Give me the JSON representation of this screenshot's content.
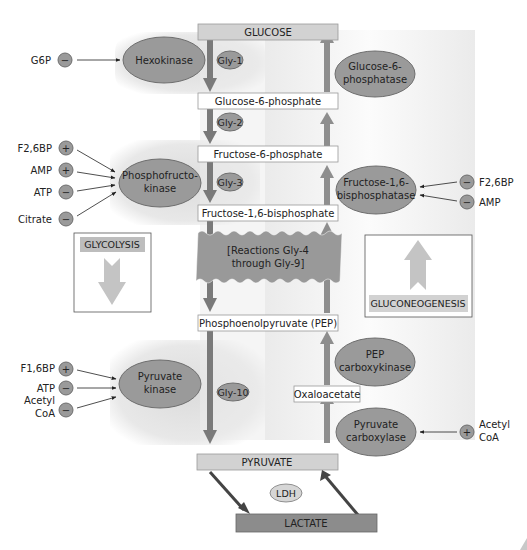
{
  "colors": {
    "enzyme_fill": "#9a9a9a",
    "enzyme_stroke": "#6e6e6e",
    "arrow_glycolysis": "#7a7a7a",
    "arrow_gluconeo": "#8e8e8e",
    "box_header_fill": "#d2d2d2",
    "metabolite_box_fill": "#ffffff",
    "lactate_fill": "#8c8c8c",
    "shade": "#e4e4e4",
    "reactions_fill": "#999999",
    "legend_arrow": "#c4c4c4"
  },
  "metabolites": {
    "glucose": "GLUCOSE",
    "g6p": "Glucose-6-phosphate",
    "f6p": "Fructose-6-phosphate",
    "f16bp": "Fructose-1,6-bisphosphate",
    "pep": "Phosphoenolpyruvate (PEP)",
    "oxaloacetate": "Oxaloacetate",
    "pyruvate": "PYRUVATE",
    "lactate": "LACTATE"
  },
  "reactions": {
    "gly1": "Gly-1",
    "gly2": "Gly-2",
    "gly3": "Gly-3",
    "gly10": "Gly-10",
    "gly4_9_line1": "[Reactions Gly-4",
    "gly4_9_line2": "through Gly-9]"
  },
  "enzymes": {
    "hexokinase": "Hexokinase",
    "g6pase_line1": "Glucose-6-",
    "g6pase_line2": "phosphatase",
    "pfk_line1": "Phosphofructo-",
    "pfk_line2": "kinase",
    "fbpase_line1": "Fructose-1,6-",
    "fbpase_line2": "bisphosphatase",
    "pepck_line1": "PEP",
    "pepck_line2": "carboxykinase",
    "pk_line1": "Pyruvate",
    "pk_line2": "kinase",
    "pc_line1": "Pyruvate",
    "pc_line2": "carboxylase",
    "ldh": "LDH"
  },
  "regulators": {
    "hexokinase": [
      {
        "name": "G6P",
        "sign": "−"
      }
    ],
    "pfk": [
      {
        "name": "F2,6BP",
        "sign": "+"
      },
      {
        "name": "AMP",
        "sign": "+"
      },
      {
        "name": "ATP",
        "sign": "−"
      },
      {
        "name": "Citrate",
        "sign": "−"
      }
    ],
    "fbpase": [
      {
        "name": "F2,6BP",
        "sign": "−"
      },
      {
        "name": "AMP",
        "sign": "−"
      }
    ],
    "pk": [
      {
        "name": "F1,6BP",
        "sign": "+"
      },
      {
        "name": "ATP",
        "sign": "−"
      },
      {
        "name": "Acetyl",
        "name2": "CoA",
        "sign": "−"
      }
    ],
    "pc": [
      {
        "name": "Acetyl",
        "name2": "CoA",
        "sign": "+"
      }
    ]
  },
  "legend": {
    "glycolysis": "GLYCOLYSIS",
    "gluconeogenesis": "GLUCONEOGENESIS"
  }
}
